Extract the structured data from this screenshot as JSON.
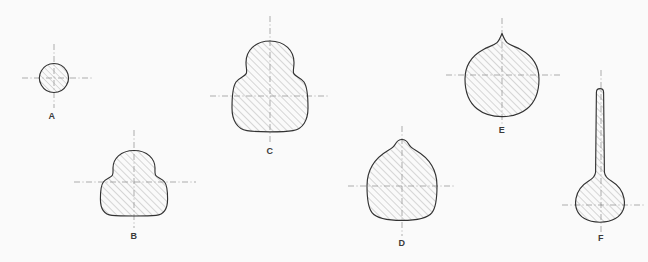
{
  "sheet": {
    "title": "Cross-Section Profiles A-F",
    "background_color": "#fefefe",
    "outline_color": "#2f2f2f",
    "hatch_color": "#9a9a9a",
    "centerline_color": "#8d8d8d",
    "label_color": "#3a3a3a",
    "width": 648,
    "height": 262
  },
  "figures": [
    {
      "id": "A",
      "label": "A",
      "shape_name": "circular-section",
      "label_x": 52,
      "label_y": 116,
      "center_x": 54,
      "center_y": 78,
      "bbox": {
        "x": 40,
        "y": 64,
        "width": 29,
        "height": 29
      },
      "hatched": true,
      "centerlines": {
        "vertical": {
          "x": 54,
          "y1": 44,
          "y2": 108
        },
        "horizontal": {
          "y": 78,
          "x1": 22,
          "x2": 92
        }
      }
    },
    {
      "id": "B",
      "label": "B",
      "shape_name": "bell-section-small",
      "label_x": 134,
      "label_y": 236,
      "center_x": 134,
      "center_y": 182,
      "bbox": {
        "x": 102,
        "y": 150,
        "width": 66,
        "height": 66
      },
      "hatched": true,
      "centerlines": {
        "vertical": {
          "x": 134,
          "y1": 130,
          "y2": 228
        },
        "horizontal": {
          "y": 182,
          "x1": 74,
          "x2": 196
        }
      }
    },
    {
      "id": "C",
      "label": "C",
      "shape_name": "bulbous-bell-section-large",
      "label_x": 270,
      "label_y": 151,
      "center_x": 270,
      "center_y": 96,
      "bbox": {
        "x": 234,
        "y": 40,
        "width": 72,
        "height": 92
      },
      "hatched": true,
      "centerlines": {
        "vertical": {
          "x": 270,
          "y1": 16,
          "y2": 144
        },
        "horizontal": {
          "y": 96,
          "x1": 210,
          "x2": 330
        }
      }
    },
    {
      "id": "D",
      "label": "D",
      "shape_name": "dome-section-with-nipple",
      "label_x": 402,
      "label_y": 243,
      "center_x": 402,
      "center_y": 186,
      "bbox": {
        "x": 366,
        "y": 139,
        "width": 72,
        "height": 82
      },
      "hatched": true,
      "centerlines": {
        "vertical": {
          "x": 402,
          "y1": 126,
          "y2": 236
        },
        "horizontal": {
          "y": 186,
          "x1": 348,
          "x2": 456
        }
      }
    },
    {
      "id": "E",
      "label": "E",
      "shape_name": "round-section-with-spike",
      "label_x": 502,
      "label_y": 130,
      "center_x": 502,
      "center_y": 75,
      "bbox": {
        "x": 464,
        "y": 33,
        "width": 76,
        "height": 84
      },
      "hatched": true,
      "centerlines": {
        "vertical": {
          "x": 502,
          "y1": 18,
          "y2": 124
        },
        "horizontal": {
          "y": 75,
          "x1": 446,
          "x2": 560
        }
      }
    },
    {
      "id": "F",
      "label": "F",
      "shape_name": "needle-section-with-bulb",
      "label_x": 601,
      "label_y": 238,
      "center_x": 601,
      "center_y": 205,
      "bbox": {
        "x": 576,
        "y": 88,
        "width": 50,
        "height": 133
      },
      "hatched": true,
      "centerlines": {
        "vertical": {
          "x": 601,
          "y1": 70,
          "y2": 232
        },
        "horizontal": {
          "y": 205,
          "x1": 562,
          "x2": 644
        }
      }
    }
  ]
}
